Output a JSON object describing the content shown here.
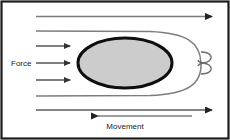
{
  "figure": {
    "background_color": "#ffffff",
    "border_color": "#1c1c1c",
    "labels": {
      "force": "Force",
      "movement": "Movement"
    },
    "body": {
      "shape": "ellipse",
      "fill_color": "#cccccc",
      "stroke_color": "#0d0d0d",
      "stroke_width": 3,
      "center_x": 125,
      "center_y": 63,
      "radius_x": 47,
      "radius_y": 25
    },
    "streamlines": {
      "color": "#8c8c8c",
      "count": 4,
      "description": "flow lines wrapping around the body"
    },
    "arrows": {
      "force_arrow_count": 3,
      "force_arrow_direction": "right",
      "movement_arrow_direction": "left",
      "top_arrow_direction": "right",
      "bottom_arrow_direction": "right",
      "color": "#4d4d4d"
    },
    "wake": {
      "description": "vortex curl at trailing edge",
      "color": "#6e6e6e"
    }
  }
}
